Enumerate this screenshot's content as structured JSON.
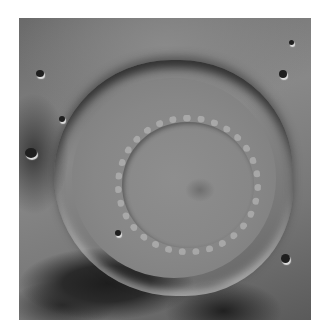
{
  "image": {
    "subject": "lunar impact crater, grayscale orbital photograph",
    "features": [
      "terraced crater rim",
      "flat crater floor",
      "central peak ring",
      "small secondary craters"
    ],
    "colors": {
      "border": "#ffffff",
      "mid_gray": "#7a7a7a",
      "shadow": "#1e1e1e",
      "highlight": "#e0e0e0"
    }
  }
}
